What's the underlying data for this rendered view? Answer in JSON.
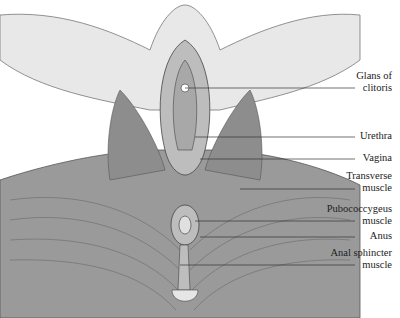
{
  "figure": {
    "labels": [
      {
        "id": "glans",
        "line1": "Glans of",
        "line2": "clitoris",
        "y": 70,
        "line_y": 88,
        "line_x1": 185
      },
      {
        "id": "urethra",
        "line1": "Urethra",
        "line2": "",
        "y": 130,
        "line_y": 137,
        "line_x1": 195
      },
      {
        "id": "vagina",
        "line1": "Vagina",
        "line2": "",
        "y": 152,
        "line_y": 159,
        "line_x1": 200
      },
      {
        "id": "transverse",
        "line1": "Transverse",
        "line2": "muscle",
        "y": 170,
        "line_y": 189,
        "line_x1": 240
      },
      {
        "id": "pubococcygeus",
        "line1": "Pubococcygeus",
        "line2": "muscle",
        "y": 203,
        "line_y": 221,
        "line_x1": 195
      },
      {
        "id": "anus",
        "line1": "Anus",
        "line2": "",
        "y": 230,
        "line_y": 237,
        "line_x1": 200
      },
      {
        "id": "anal_sphincter",
        "line1": "Anal sphincter",
        "line2": "muscle",
        "y": 247,
        "line_y": 265,
        "line_x1": 180
      }
    ]
  }
}
